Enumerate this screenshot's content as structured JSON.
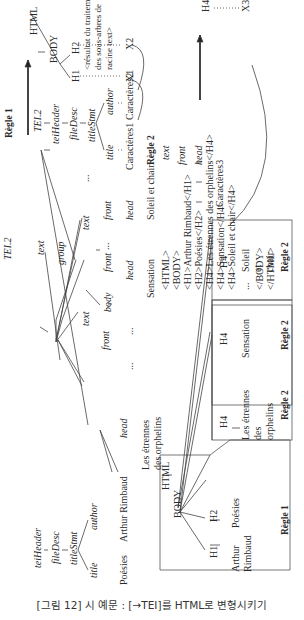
{
  "caption": "[그림 12] 시 예문 : [→TEI]를 HTML로 변형시키기",
  "regle1_top": {
    "title": "Règle 1",
    "source_tree": [
      "TEI.2",
      "teiHeader",
      "fileDesc",
      "titleStmt",
      "title",
      "author",
      "Caractères1",
      "Caractères2"
    ],
    "target_tree": [
      "HTML",
      "BODY",
      "H1",
      "H2",
      "X1",
      "X2"
    ],
    "note": [
      "<résultat du traitement",
      "des sous-arbres de",
      "racine text>"
    ]
  },
  "regle2_top": {
    "title": "Règle 2",
    "source_tree": [
      "text",
      "front",
      "head",
      "Caractères3"
    ],
    "target_tree": [
      "H4",
      "X3"
    ]
  },
  "main_tree": {
    "root": "TEI.2",
    "teiHeader": "teiHeader",
    "fileDesc": "fileDesc",
    "titleStmt": "titleStmt",
    "title": "title",
    "author": "author",
    "poesies": "Poésies",
    "author_name": "Arthur Rimbaud",
    "text": "text",
    "front": "front",
    "head": "head",
    "etrennes": [
      "Les étrennes",
      "des orphelins"
    ],
    "group": "group",
    "text2": "text",
    "body": "body",
    "front2": "front",
    "head2": "head",
    "sensation": "Sensation",
    "text3": "text",
    "front3": "front",
    "head3": "head",
    "soleil": "Soleil et chair",
    "ellipsis": "..."
  },
  "html_output": [
    "<HTML>",
    "<BODY>",
    "<H1>Arthur Rimbaud</H1>",
    "<H2>Poésies</H2>",
    "<H4>Les étrennes des orphelins</H4>",
    "<H4>Sensation</H4>",
    "<H4>Soleil et chair</H4>",
    "...",
    "</BODY>",
    "</HTML>"
  ],
  "result_tree": {
    "html": "HTML",
    "body": "BODY",
    "h1": "H1",
    "h1_text": [
      "Arthur",
      "Rimbaud"
    ],
    "h2": "H2",
    "h2_text": "Poésies",
    "regle1": "Règle 1",
    "boxes": [
      {
        "tag": "H4",
        "text": [
          "Les étrennes",
          "des",
          "orphelins"
        ],
        "rule": "Règle 2"
      },
      {
        "tag": "H4",
        "text": [
          "Sensation"
        ],
        "rule": "Règle 2"
      },
      {
        "tag": "H4",
        "text": [
          "Soleil",
          "et",
          "chair"
        ],
        "rule": "Règle 2"
      }
    ]
  }
}
